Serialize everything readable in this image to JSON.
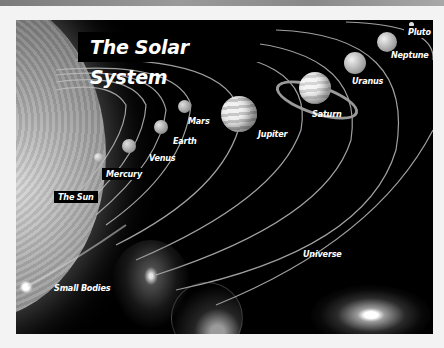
{
  "poster": {
    "title": "The Solar System",
    "labels": {
      "sun": "The Sun",
      "mercury": "Mercury",
      "venus": "Venus",
      "earth": "Earth",
      "mars": "Mars",
      "jupiter": "Jupiter",
      "saturn": "Saturn",
      "uranus": "Uranus",
      "neptune": "Neptune",
      "pluto": "Pluto",
      "small_bodies": "Small Bodies",
      "universe": "Universe"
    }
  }
}
